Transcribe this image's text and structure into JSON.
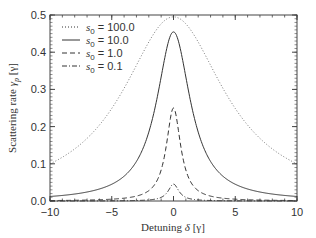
{
  "chart_data": {
    "type": "line",
    "title": "",
    "xlabel": "Detuning δ [γ]",
    "ylabel": "Scattering rate γp [γ]",
    "xlim": [
      -10,
      10
    ],
    "ylim": [
      0,
      0.5
    ],
    "x_ticks": [
      -10,
      -5,
      0,
      5,
      10
    ],
    "x_tick_labels": [
      "−10",
      "−5",
      "0",
      "5",
      "10"
    ],
    "y_ticks": [
      0.0,
      0.1,
      0.2,
      0.3,
      0.4,
      0.5
    ],
    "y_tick_labels": [
      "0.0",
      "0.1",
      "0.2",
      "0.3",
      "0.4",
      "0.5"
    ],
    "grid": false,
    "legend_position": "upper-left",
    "x": [
      -10,
      -8,
      -6,
      -5,
      -4,
      -3,
      -2,
      -1.5,
      -1,
      -0.5,
      0,
      0.5,
      1,
      1.5,
      2,
      3,
      4,
      5,
      6,
      8,
      10
    ],
    "series": [
      {
        "name": "s0 = 100.0",
        "s0": 100.0,
        "style": "dotted",
        "values": [
          0.1,
          0.14,
          0.208,
          0.249,
          0.301,
          0.369,
          0.428,
          0.455,
          0.476,
          0.49,
          0.495,
          0.49,
          0.476,
          0.455,
          0.428,
          0.369,
          0.301,
          0.249,
          0.208,
          0.14,
          0.1
        ]
      },
      {
        "name": "s0 = 10.0",
        "s0": 10.0,
        "style": "solid",
        "values": [
          0.012,
          0.019,
          0.032,
          0.045,
          0.067,
          0.106,
          0.185,
          0.25,
          0.333,
          0.417,
          0.455,
          0.417,
          0.333,
          0.25,
          0.185,
          0.106,
          0.067,
          0.045,
          0.032,
          0.019,
          0.012
        ]
      },
      {
        "name": "s0 = 1.0",
        "s0": 1.0,
        "style": "dashed",
        "values": [
          0.001,
          0.002,
          0.003,
          0.005,
          0.008,
          0.013,
          0.028,
          0.045,
          0.083,
          0.167,
          0.25,
          0.167,
          0.083,
          0.045,
          0.028,
          0.013,
          0.008,
          0.005,
          0.003,
          0.002,
          0.001
        ]
      },
      {
        "name": "s0 = 0.1",
        "s0": 0.1,
        "style": "dash-dot",
        "values": [
          0.0001,
          0.0002,
          0.0003,
          0.0005,
          0.0008,
          0.0014,
          0.0029,
          0.005,
          0.0098,
          0.0238,
          0.0455,
          0.0238,
          0.0098,
          0.005,
          0.0029,
          0.0014,
          0.0008,
          0.0005,
          0.0003,
          0.0002,
          0.0001
        ]
      }
    ],
    "model": "γp = (s0/2) / (1 + s0 + 4δ²)"
  },
  "legend": {
    "entries": [
      {
        "symbol": "s",
        "sub": "0",
        "value": "= 100.0"
      },
      {
        "symbol": "s",
        "sub": "0",
        "value": "=   10.0"
      },
      {
        "symbol": "s",
        "sub": "0",
        "value": "=     1.0"
      },
      {
        "symbol": "s",
        "sub": "0",
        "value": "=     0.1"
      }
    ]
  },
  "axes": {
    "xlabel_main": "Detuning ",
    "xlabel_sym": "δ",
    "xlabel_unit": " [γ]",
    "ylabel_main": "Scattering rate ",
    "ylabel_sym": "γ",
    "ylabel_sub": "p",
    "ylabel_unit": " [γ]"
  }
}
